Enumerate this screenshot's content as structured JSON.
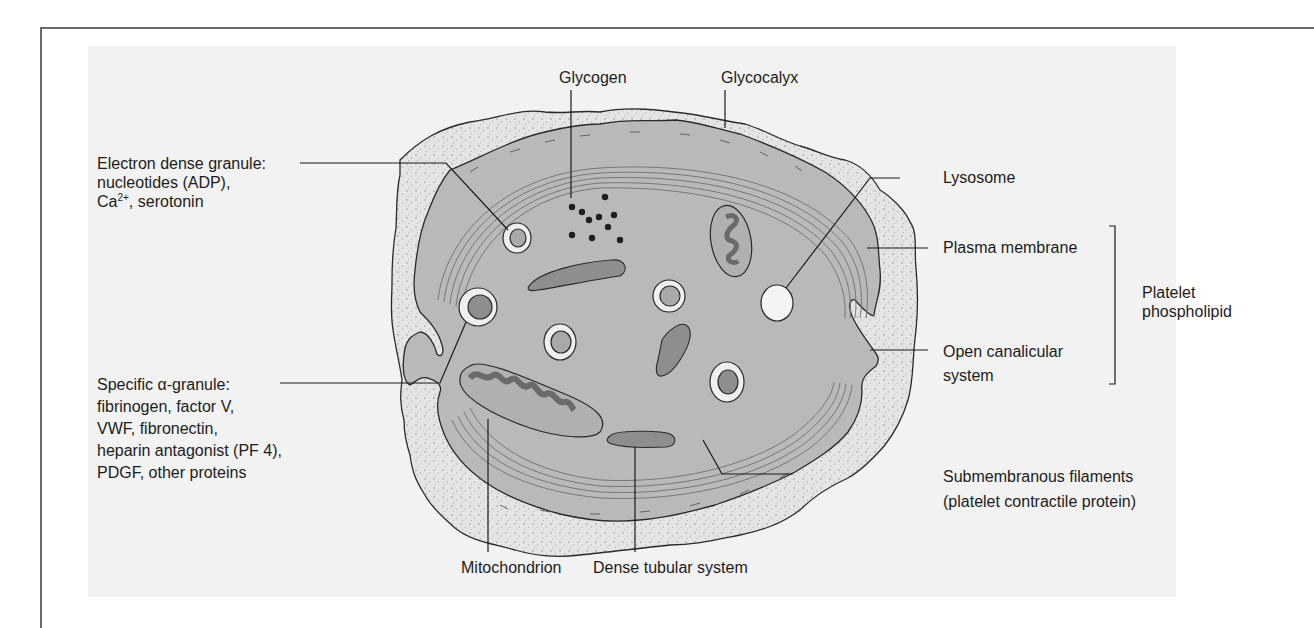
{
  "diagram": {
    "colors": {
      "background": "#ffffff",
      "panel": "#f2f2f2",
      "glycocalyx": "#e6e6e6",
      "cytoplasm": "#b9b9b9",
      "organelle_dark": "#8e8e8e",
      "lysosome": "#f4f4f4",
      "outline": "#2a2a2a"
    }
  },
  "labels": {
    "glycogen": "Glycogen",
    "glycocalyx": "Glycocalyx",
    "electron_dense_granule": {
      "line1": "Electron dense granule:",
      "line2": "nucleotides (ADP),",
      "line3_prefix": "Ca",
      "line3_sup": "2+",
      "line3_suffix": ", serotonin"
    },
    "lysosome": "Lysosome",
    "plasma_membrane": "Plasma membrane",
    "platelet_phospholipid": {
      "line1": "Platelet",
      "line2": "phospholipid"
    },
    "alpha_granule": {
      "line1": "Specific α-granule:",
      "line2": "fibrinogen, factor V,",
      "line3": "VWF, fibronectin,",
      "line4": "heparin antagonist (PF 4),",
      "line5": "PDGF, other proteins"
    },
    "open_canalicular_system": {
      "line1": "Open canalicular",
      "line2": "system"
    },
    "submembranous_filaments": {
      "line1": "Submembranous filaments",
      "line2": "(platelet contractile protein)"
    },
    "mitochondrion": "Mitochondrion",
    "dense_tubular_system": "Dense tubular system"
  }
}
